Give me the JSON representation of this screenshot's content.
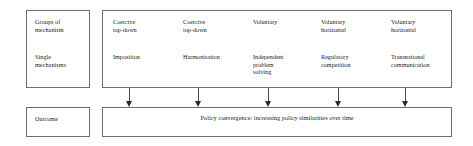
{
  "figure": {
    "row_labels": {
      "groups": "Groups of\nmechanism",
      "single": "Single\nmechanisms",
      "outcome": "Outcome"
    },
    "columns": [
      {
        "group": "Coercive\ntop-down",
        "mechanism": "Imposition"
      },
      {
        "group": "Coercive\ntop-down",
        "mechanism": "Harmonisation"
      },
      {
        "group": "Voluntary",
        "mechanism": "Independent\nproblem\nsolving"
      },
      {
        "group": "Voluntary\nhorizontal",
        "mechanism": "Regulatory\ncompetition"
      },
      {
        "group": "Voluntary\nhorizontal",
        "mechanism": "Transnational\ncommunication"
      }
    ],
    "outcome_text": "Policy convergence: increasing policy similarities over time",
    "arrow_count": 5,
    "colors": {
      "border": "#6d6d6d",
      "arrow": "#2a2a2a",
      "text": "#1d1d1d",
      "background": "#ffffff"
    }
  }
}
